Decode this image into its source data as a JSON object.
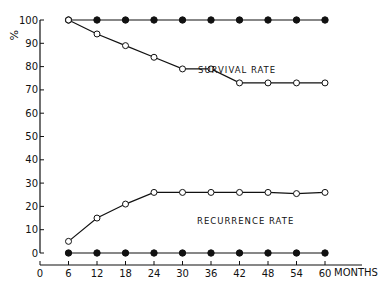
{
  "chart_data": {
    "type": "line",
    "title": "",
    "xlabel": "MONTHS",
    "ylabel": "%",
    "x": [
      6,
      12,
      18,
      24,
      30,
      36,
      42,
      48,
      54,
      60
    ],
    "x_ticks": [
      0,
      6,
      12,
      18,
      24,
      30,
      36,
      42,
      48,
      54,
      60
    ],
    "y_ticks": [
      0,
      10,
      20,
      30,
      40,
      50,
      60,
      70,
      80,
      90,
      100
    ],
    "xlim": [
      0,
      60
    ],
    "ylim": [
      0,
      100
    ],
    "grid": false,
    "legend_position": "none",
    "annotations": [
      {
        "text": "SURVIVAL RATE",
        "x": 30,
        "y": 88
      },
      {
        "text": "RECURRENCE RATE",
        "x": 36,
        "y": 13
      }
    ],
    "series": [
      {
        "name": "Survival rate (filled)",
        "marker": "filled-circle",
        "values": [
          100,
          100,
          100,
          100,
          100,
          100,
          100,
          100,
          100,
          100
        ]
      },
      {
        "name": "Survival rate (open)",
        "marker": "open-circle",
        "values": [
          100,
          94,
          89,
          84,
          79,
          79,
          73,
          73,
          73,
          73
        ]
      },
      {
        "name": "Recurrence rate (open)",
        "marker": "open-circle",
        "values": [
          5,
          15,
          21,
          26,
          26,
          26,
          26,
          26,
          25.5,
          26
        ]
      },
      {
        "name": "Recurrence rate (filled)",
        "marker": "filled-circle",
        "values": [
          0,
          0,
          0,
          0,
          0,
          0,
          0,
          0,
          0,
          0
        ]
      }
    ]
  },
  "labels": {
    "y_unit": "%",
    "x_unit": "MONTHS",
    "survival": "SURVIVAL RATE",
    "recurrence": "RECURRENCE RATE"
  }
}
